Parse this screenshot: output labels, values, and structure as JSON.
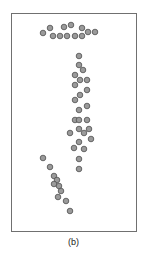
{
  "caption": "(b)",
  "style": {
    "dot_fill": "#9a9a9a",
    "dot_stroke": "#4f4f4f",
    "frame_color": "#707070"
  },
  "dots": [
    [
      43,
      33
    ],
    [
      50,
      28
    ],
    [
      53,
      36
    ],
    [
      60,
      36
    ],
    [
      64,
      27
    ],
    [
      71,
      25
    ],
    [
      67,
      36
    ],
    [
      75,
      36
    ],
    [
      82,
      28
    ],
    [
      82,
      36
    ],
    [
      88,
      32
    ],
    [
      95,
      32
    ],
    [
      79,
      56
    ],
    [
      79,
      65
    ],
    [
      83,
      70
    ],
    [
      75,
      75
    ],
    [
      80,
      80
    ],
    [
      87,
      80
    ],
    [
      75,
      85
    ],
    [
      87,
      90
    ],
    [
      80,
      95
    ],
    [
      75,
      100
    ],
    [
      87,
      106
    ],
    [
      79,
      110
    ],
    [
      75,
      120
    ],
    [
      79,
      120
    ],
    [
      87,
      120
    ],
    [
      70,
      133
    ],
    [
      79,
      129
    ],
    [
      84,
      133
    ],
    [
      89,
      129
    ],
    [
      91,
      139
    ],
    [
      79,
      142
    ],
    [
      74,
      148
    ],
    [
      84,
      149
    ],
    [
      79,
      159
    ],
    [
      79,
      169
    ],
    [
      43,
      158
    ],
    [
      50,
      167
    ],
    [
      54,
      176
    ],
    [
      57,
      180
    ],
    [
      54,
      184
    ],
    [
      59,
      186
    ],
    [
      61,
      191
    ],
    [
      58,
      197
    ],
    [
      66,
      201
    ],
    [
      70,
      211
    ]
  ]
}
